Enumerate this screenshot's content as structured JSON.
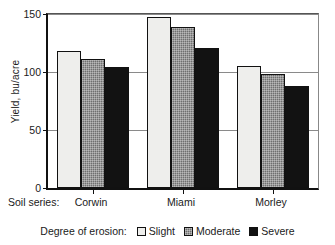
{
  "chart_data": {
    "type": "bar",
    "title": "",
    "xlabel": "Soil series:",
    "ylabel": "Yield, bu/acre",
    "categories": [
      "Corwin",
      "Miami",
      "Morley"
    ],
    "series": [
      {
        "name": "Slight",
        "values": [
          118,
          147,
          105
        ],
        "color": "#eeeeec"
      },
      {
        "name": "Moderate",
        "values": [
          111,
          139,
          98
        ],
        "color": "#6f6f6f"
      },
      {
        "name": "Severe",
        "values": [
          104,
          121,
          88
        ],
        "color": "#121212"
      }
    ],
    "ylim": [
      0,
      150
    ],
    "yticks": [
      0,
      50,
      100,
      150
    ],
    "ytick_labels": [
      "0",
      "50",
      "100",
      "150"
    ],
    "grid": true,
    "grid_axis": "y",
    "legend_title": "Degree of erosion:",
    "legend_position": "bottom-center",
    "legend_entries": [
      "Slight",
      "Moderate",
      "Severe"
    ]
  },
  "axes": {
    "y_title": "Yield, bu/acre",
    "y_tick_0": "0",
    "y_tick_1": "50",
    "y_tick_2": "100",
    "y_tick_3": "150",
    "x_prefix": "Soil series:",
    "x_cat_0": "Corwin",
    "x_cat_1": "Miami",
    "x_cat_2": "Morley"
  },
  "legend": {
    "title": "Degree of erosion:",
    "item_0": "Slight",
    "item_1": "Moderate",
    "item_2": "Severe"
  }
}
